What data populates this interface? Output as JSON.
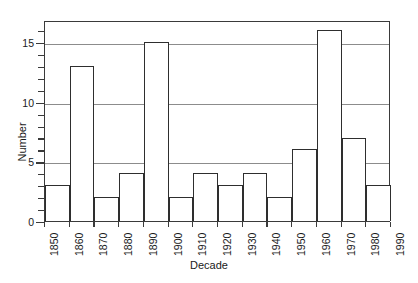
{
  "chart_data": {
    "type": "bar",
    "title": "",
    "subtitle": "",
    "xlabel": "Decade",
    "ylabel": "Number",
    "categories": [
      "1850",
      "1860",
      "1870",
      "1880",
      "1890",
      "1900",
      "1910",
      "1920",
      "1930",
      "1940",
      "1950",
      "1960",
      "1970",
      "1980",
      "1990"
    ],
    "values": [
      3,
      13,
      2,
      4,
      15,
      2,
      4,
      3,
      4,
      2,
      6,
      16,
      7,
      3,
      0
    ],
    "xlim": [
      "1850",
      "1990"
    ],
    "ylim": [
      0,
      16.85
    ],
    "ytick_labels": [
      "0",
      "5",
      "10",
      "15"
    ],
    "ytick_values": [
      0,
      5,
      10,
      15
    ],
    "y_minor_tick_interval": 1,
    "gridlines": [
      5,
      10,
      15
    ],
    "grid": true,
    "legend": null,
    "legend_position": "none",
    "bar_style": "outlined-white-histogram",
    "annotations": [],
    "colors": {
      "bar_outline": "#2e2e2e",
      "bar_fill": "#ffffff",
      "gridline": "#8c8c8c",
      "axis": "#3a3a3a",
      "text": "#1a1a1a",
      "background": "#ffffff"
    }
  },
  "axes": {
    "y_title": "Number",
    "x_title": "Decade"
  }
}
